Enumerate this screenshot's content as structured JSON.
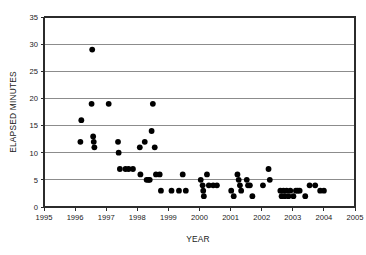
{
  "chart_data": {
    "type": "scatter",
    "title": "",
    "xlabel": "YEAR",
    "ylabel": "ELAPSED MINUTES",
    "xlim": [
      1995,
      2005
    ],
    "ylim": [
      0,
      35
    ],
    "xticks": [
      1995,
      1996,
      1997,
      1998,
      1999,
      2000,
      2001,
      2002,
      2003,
      2004,
      2005
    ],
    "yticks": [
      0,
      5,
      10,
      15,
      20,
      25,
      30,
      35
    ],
    "xtick_labels": [
      "1995",
      "1996",
      "1997",
      "1998",
      "1999",
      "2000",
      "2001",
      "2002",
      "2003",
      "2004",
      "2005"
    ],
    "ytick_labels": [
      "0",
      "5",
      "10",
      "15",
      "20",
      "25",
      "30",
      "35"
    ],
    "grid": "horizontal",
    "legend": "none",
    "marker": "filled-circle",
    "marker_color": "#000000",
    "marker_size": 4.2,
    "points": [
      [
        1996.17,
        12
      ],
      [
        1996.2,
        16
      ],
      [
        1996.53,
        19
      ],
      [
        1996.55,
        29
      ],
      [
        1996.58,
        13
      ],
      [
        1996.6,
        12
      ],
      [
        1996.62,
        11
      ],
      [
        1997.08,
        19
      ],
      [
        1997.38,
        12
      ],
      [
        1997.4,
        10
      ],
      [
        1997.44,
        7
      ],
      [
        1997.62,
        7
      ],
      [
        1997.72,
        7
      ],
      [
        1997.86,
        7
      ],
      [
        1998.08,
        11
      ],
      [
        1998.1,
        6
      ],
      [
        1998.24,
        12
      ],
      [
        1998.3,
        5
      ],
      [
        1998.36,
        5
      ],
      [
        1998.4,
        5
      ],
      [
        1998.46,
        14
      ],
      [
        1998.5,
        19
      ],
      [
        1998.56,
        11
      ],
      [
        1998.6,
        6
      ],
      [
        1998.72,
        6
      ],
      [
        1998.76,
        3
      ],
      [
        1999.1,
        3
      ],
      [
        1999.34,
        3
      ],
      [
        1999.46,
        6
      ],
      [
        1999.56,
        3
      ],
      [
        2000.04,
        5
      ],
      [
        2000.1,
        4
      ],
      [
        2000.12,
        3
      ],
      [
        2000.14,
        2
      ],
      [
        2000.24,
        6
      ],
      [
        2000.3,
        4
      ],
      [
        2000.44,
        4
      ],
      [
        2000.56,
        4
      ],
      [
        2001.02,
        3
      ],
      [
        2001.1,
        2
      ],
      [
        2001.22,
        6
      ],
      [
        2001.26,
        5
      ],
      [
        2001.3,
        4
      ],
      [
        2001.34,
        3
      ],
      [
        2001.52,
        5
      ],
      [
        2001.56,
        4
      ],
      [
        2001.62,
        4
      ],
      [
        2001.7,
        2
      ],
      [
        2002.04,
        4
      ],
      [
        2002.22,
        7
      ],
      [
        2002.26,
        5
      ],
      [
        2002.6,
        3
      ],
      [
        2002.64,
        2
      ],
      [
        2002.7,
        3
      ],
      [
        2002.74,
        2
      ],
      [
        2002.8,
        3
      ],
      [
        2002.86,
        2
      ],
      [
        2002.92,
        3
      ],
      [
        2003.02,
        2
      ],
      [
        2003.1,
        3
      ],
      [
        2003.16,
        3
      ],
      [
        2003.22,
        3
      ],
      [
        2003.4,
        2
      ],
      [
        2003.54,
        4
      ],
      [
        2003.72,
        4
      ],
      [
        2003.88,
        3
      ],
      [
        2004.0,
        3
      ]
    ]
  },
  "colors": {
    "marker": "#000000",
    "grid": "#8c8c8c",
    "axis": "#2b2b2b",
    "background": "#ffffff"
  }
}
